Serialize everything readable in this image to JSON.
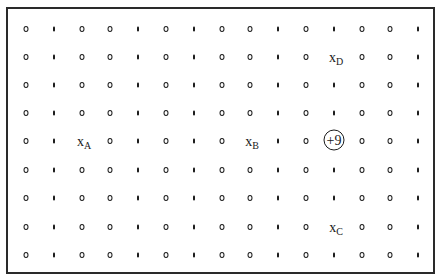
{
  "diagram": {
    "type": "electric-field-point-grid",
    "grid": {
      "columns": 15,
      "rows": 9,
      "column_x": [
        26,
        54,
        82,
        110,
        138,
        166,
        194,
        222,
        250,
        278,
        306,
        334,
        362,
        390,
        418
      ],
      "row_y": [
        29,
        57,
        85,
        113,
        141,
        170,
        198,
        227,
        255
      ],
      "column_pattern": [
        "ring",
        "bar",
        "ring",
        "ring",
        "bar",
        "ring",
        "bar",
        "ring",
        "ring",
        "bar",
        "ring",
        "bar",
        "ring",
        "ring",
        "bar"
      ]
    },
    "charge": {
      "label": "+9",
      "row": 4,
      "col": 11
    },
    "points": [
      {
        "id": "A",
        "prefix": "x",
        "sub": "A",
        "row": 4,
        "col": 2
      },
      {
        "id": "B",
        "prefix": "x",
        "sub": "B",
        "row": 4,
        "col": 8
      },
      {
        "id": "C",
        "prefix": "x",
        "sub": "C",
        "row": 7,
        "col": 11
      },
      {
        "id": "D",
        "prefix": "x",
        "sub": "D",
        "row": 1,
        "col": 11
      }
    ],
    "colors": {
      "ink": "#1c1c1c",
      "border": "#2a2a2a",
      "background": "#ffffff"
    }
  }
}
